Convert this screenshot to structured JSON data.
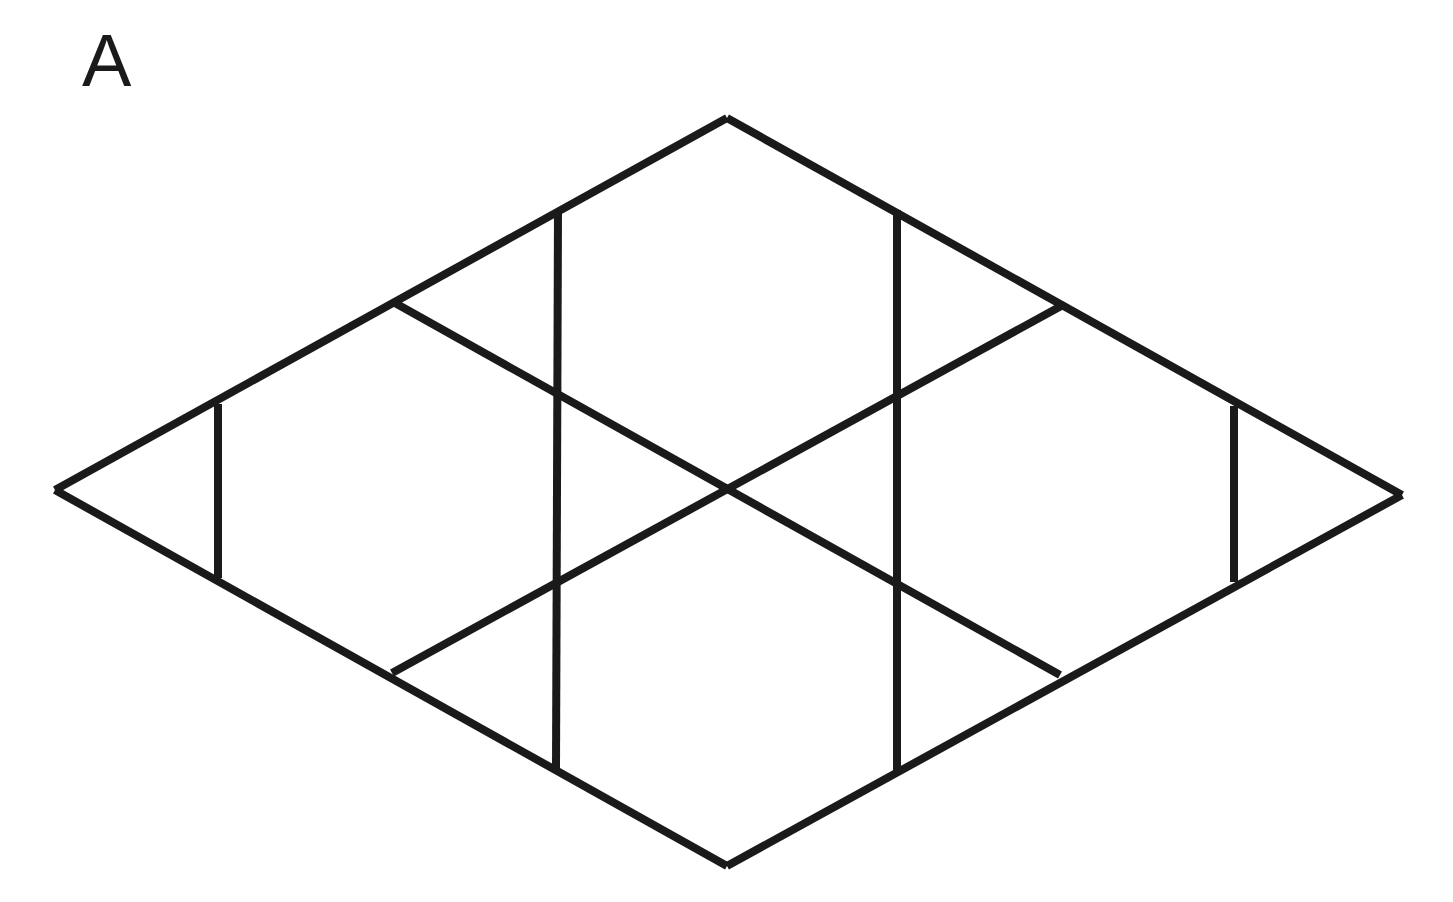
{
  "figure": {
    "panel_label": "A",
    "background_color": "#ffffff",
    "stroke_color": "#1a1a1a",
    "stroke_width": 8,
    "canvas": {
      "width": 1453,
      "height": 902
    }
  },
  "chart_data": {
    "type": "diagram",
    "xlabel": "",
    "ylabel": "",
    "xlim": [
      0,
      1453
    ],
    "ylim": [
      0,
      902
    ],
    "grid": false,
    "legend": null,
    "annotations": [
      {
        "text": "A",
        "x": 82,
        "y": 24,
        "role": "panel-label"
      }
    ],
    "points": {
      "left_vertex": {
        "x": 55,
        "y": 490
      },
      "right_vertex": {
        "x": 1402,
        "y": 495
      },
      "top_vertex": {
        "x": 727,
        "y": 118
      },
      "bottom_vertex": {
        "x": 727,
        "y": 866
      },
      "center": {
        "x": 727,
        "y": 492
      },
      "upper_left_node": {
        "x": 395,
        "y": 303
      },
      "upper_right_node": {
        "x": 1063,
        "y": 305
      },
      "lower_left_node": {
        "x": 392,
        "y": 673
      },
      "lower_right_node": {
        "x": 1060,
        "y": 675
      },
      "top_left_tick": {
        "x": 558,
        "y": 210
      },
      "top_right_tick": {
        "x": 897,
        "y": 210
      },
      "bottom_left_tick": {
        "x": 556,
        "y": 770
      },
      "bottom_right_tick": {
        "x": 897,
        "y": 770
      },
      "left_bar_top": {
        "x": 218,
        "y": 404
      },
      "left_bar_bottom": {
        "x": 218,
        "y": 578
      },
      "right_bar_top": {
        "x": 1234,
        "y": 406
      },
      "right_bar_bottom": {
        "x": 1234,
        "y": 582
      },
      "hex_upper_left": {
        "x": 558,
        "y": 395
      },
      "hex_upper_right": {
        "x": 897,
        "y": 398
      },
      "hex_lower_left": {
        "x": 558,
        "y": 585
      },
      "hex_lower_right": {
        "x": 897,
        "y": 585
      }
    },
    "segments": [
      {
        "name": "outline-top-left",
        "x1": 55,
        "y1": 490,
        "x2": 727,
        "y2": 118
      },
      {
        "name": "outline-top-right",
        "x1": 727,
        "y1": 118,
        "x2": 1402,
        "y2": 495
      },
      {
        "name": "outline-bottom-right",
        "x1": 1402,
        "y1": 495,
        "x2": 727,
        "y2": 866
      },
      {
        "name": "outline-bottom-left",
        "x1": 727,
        "y1": 866,
        "x2": 55,
        "y2": 490
      },
      {
        "name": "diagonal-upper-left-to-lower-right",
        "x1": 395,
        "y1": 303,
        "x2": 1060,
        "y2": 675
      },
      {
        "name": "diagonal-upper-right-to-lower-left",
        "x1": 1063,
        "y1": 305,
        "x2": 392,
        "y2": 673
      },
      {
        "name": "vertical-left-short",
        "x1": 218,
        "y1": 404,
        "x2": 218,
        "y2": 578
      },
      {
        "name": "vertical-right-short",
        "x1": 1234,
        "y1": 406,
        "x2": 1234,
        "y2": 582
      },
      {
        "name": "vertical-center-left",
        "x1": 558,
        "y1": 210,
        "x2": 556,
        "y2": 770
      },
      {
        "name": "vertical-center-right",
        "x1": 897,
        "y1": 210,
        "x2": 897,
        "y2": 770
      }
    ]
  }
}
